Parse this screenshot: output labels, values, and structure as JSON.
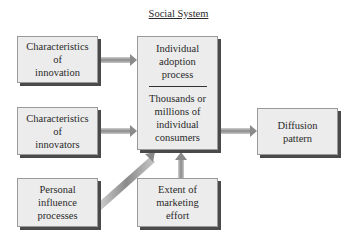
{
  "title": "Social System",
  "boxes": {
    "innovation": [
      "Characteristics",
      "of",
      "innovation"
    ],
    "innovators": [
      "Characteristics",
      "of",
      "innovators"
    ],
    "personal": [
      "Personal",
      "influence",
      "processes"
    ],
    "adoption": [
      "Individual",
      "adoption",
      "process"
    ],
    "consumers": [
      "Thousands or",
      "millions of",
      "individual",
      "consumers"
    ],
    "marketing": [
      "Extent of",
      "marketing",
      "effort"
    ],
    "diffusion": [
      "Diffusion",
      "pattern"
    ]
  },
  "colors": {
    "box_fill": "#ececec",
    "shadow": "#4a4a4a",
    "arrow": "#9a9a9a"
  }
}
